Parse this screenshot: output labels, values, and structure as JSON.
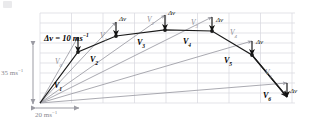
{
  "figure": {
    "type": "vector-diagram",
    "background": "#ffffff",
    "colors": {
      "grid": "#d7d7de",
      "vector_black": "#1a1a1a",
      "vector_gray": "#9b9ba3",
      "axis_gray": "#9b9ba3",
      "delta_arrow": "#111111",
      "text": "#000000",
      "text_gray": "#8a8a90"
    }
  },
  "key": {
    "label_plain": "Δv = 10 ms",
    "label_exponent": "−1",
    "full": "Δv = 10 ms⁻¹"
  },
  "axes": {
    "vertical": {
      "value": "35 ms",
      "exponent": "−1",
      "full": "35 ms⁻¹",
      "arrow": "double-headed-vertical"
    },
    "horizontal": {
      "value": "20 ms",
      "exponent": "−1",
      "full": "20 ms⁻¹",
      "arrow": "double-headed-horizontal"
    }
  },
  "grid": {
    "visible": true,
    "left": 40,
    "right": 295,
    "top": 13,
    "bottom": 103,
    "h_spacing": 10,
    "v_spacing": 31.5,
    "h_lines": 10,
    "v_lines": 9
  },
  "origin": {
    "x": 40,
    "y": 103
  },
  "vectors_black": [
    {
      "name": "V",
      "sub": "1",
      "tip_x": 78,
      "tip_y": 52,
      "label_x": 54,
      "label_y": 82
    },
    {
      "name": "V",
      "sub": "2",
      "tip_x": 116,
      "tip_y": 36,
      "label_x": 90,
      "label_y": 56
    },
    {
      "name": "V",
      "sub": "3",
      "tip_x": 165,
      "tip_y": 30,
      "label_x": 137,
      "label_y": 39
    },
    {
      "name": "V",
      "sub": "4",
      "tip_x": 212,
      "tip_y": 31,
      "label_x": 183,
      "label_y": 38
    },
    {
      "name": "V",
      "sub": "5",
      "tip_x": 252,
      "tip_y": 55,
      "label_x": 224,
      "label_y": 57
    },
    {
      "name": "V",
      "sub": "6",
      "tip_x": 287,
      "tip_y": 97,
      "label_x": 263,
      "label_y": 92
    }
  ],
  "vectors_gray": [
    {
      "name": "V",
      "sub": "0",
      "tip_x": 78,
      "tip_y": 37,
      "label_x": 55,
      "label_y": 58
    },
    {
      "name": "V",
      "sub": "1",
      "tip_x": 116,
      "tip_y": 22,
      "label_x": 100,
      "label_y": 32
    },
    {
      "name": "V",
      "sub": "2",
      "tip_x": 165,
      "tip_y": 15,
      "label_x": 147,
      "label_y": 16
    },
    {
      "name": "V",
      "sub": "3",
      "tip_x": 212,
      "tip_y": 17,
      "label_x": 191,
      "label_y": 19
    },
    {
      "name": "V",
      "sub": "4",
      "tip_x": 252,
      "tip_y": 41,
      "label_x": 230,
      "label_y": 29
    },
    {
      "name": "V",
      "sub": "5",
      "tip_x": 287,
      "tip_y": 83,
      "label_x": 265,
      "label_y": 69
    }
  ],
  "delta_arrows": [
    {
      "label": "Δv",
      "x1": 78,
      "y1": 37,
      "x2": 78,
      "y2": 52,
      "label_x": 40,
      "label_y": 28,
      "show_label": false
    },
    {
      "label": "Δv",
      "x1": 116,
      "y1": 22,
      "x2": 116,
      "y2": 36,
      "label_x": 119,
      "label_y": 16,
      "show_label": true
    },
    {
      "label": "Δv",
      "x1": 165,
      "y1": 15,
      "x2": 165,
      "y2": 30,
      "label_x": 168,
      "label_y": 10,
      "show_label": true
    },
    {
      "label": "Δv",
      "x1": 212,
      "y1": 17,
      "x2": 212,
      "y2": 31,
      "label_x": 216,
      "label_y": 17,
      "show_label": true
    },
    {
      "label": "Δv",
      "x1": 252,
      "y1": 41,
      "x2": 252,
      "y2": 55,
      "label_x": 256,
      "label_y": 39,
      "show_label": true
    },
    {
      "label": "Δv",
      "x1": 287,
      "y1": 83,
      "x2": 287,
      "y2": 97,
      "label_x": 290,
      "label_y": 88,
      "show_label": true
    }
  ],
  "key_arrow": {
    "x1": 78,
    "y1": 37,
    "x2": 78,
    "y2": 52
  },
  "labels": {
    "delta_v": "Δv"
  }
}
